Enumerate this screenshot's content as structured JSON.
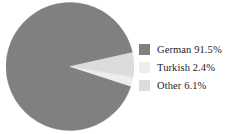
{
  "chart_data": {
    "type": "pie",
    "title": "",
    "categories": [
      "German",
      "Turkish",
      "Other"
    ],
    "values": [
      91.5,
      2.4,
      6.1
    ],
    "value_suffix": "%",
    "labels": [
      "German 91.5%",
      "Turkish 2.4%",
      "Other 6.1%"
    ],
    "colors": [
      "#808080",
      "#ededed",
      "#dcdcdc"
    ],
    "legend_position": "right",
    "grid": false,
    "start_angle_deg": -12.6,
    "direction": "counterclockwise",
    "slices": [
      {
        "name": "German",
        "value": 91.5,
        "display": "91.5%",
        "color": "#808080"
      },
      {
        "name": "Turkish",
        "value": 2.4,
        "display": "2.4%",
        "color": "#ededed"
      },
      {
        "name": "Other",
        "value": 6.1,
        "display": "6.1%",
        "color": "#dcdcdc"
      }
    ]
  },
  "legend": {
    "items": [
      {
        "label": "German 91.5%",
        "color": "#808080",
        "swatch_name": "legend-swatch-german"
      },
      {
        "label": "Turkish 2.4%",
        "color": "#ededed",
        "swatch_name": "legend-swatch-turkish"
      },
      {
        "label": "Other 6.1%",
        "color": "#dcdcdc",
        "swatch_name": "legend-swatch-other"
      }
    ]
  }
}
